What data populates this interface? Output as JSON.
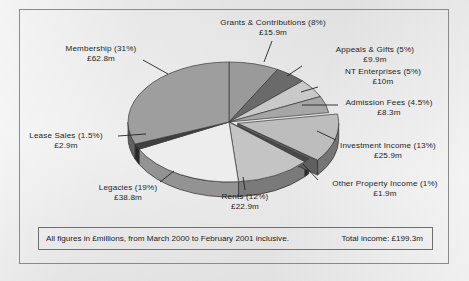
{
  "chart_data": {
    "type": "pie",
    "title": "",
    "units": "£ millions",
    "total_label": "Total income: £199.3m",
    "total_value": 199.3,
    "legend": "none",
    "categories": [
      "Grants & Contributions",
      "Appeals & Gifts",
      "NT Enterprises",
      "Admission Fees",
      "Investment Income",
      "Other Property Income",
      "Rents",
      "Legacies",
      "Lease Sales",
      "Membership"
    ],
    "percentages": [
      8,
      5,
      5,
      4.5,
      13,
      1,
      12,
      19,
      1.5,
      31
    ],
    "values": [
      15.9,
      9.9,
      10,
      8.3,
      25.9,
      1.9,
      22.9,
      38.8,
      2.9,
      62.8
    ],
    "value_labels": [
      "£15.9m",
      "£9.9m",
      "£10m",
      "£8.3m",
      "£25.9m",
      "£1.9m",
      "£22.9m",
      "£38.8m",
      "£2.9m",
      "£62.8m"
    ],
    "percent_labels": [
      "(8%)",
      "(5%)",
      "(5%)",
      "(4.5%)",
      "(13%)",
      "(1%)",
      "(12%)",
      "(19%)",
      "(1.5%)",
      "(31%)"
    ],
    "colors": [
      "#9a9a9a",
      "#6a6a6a",
      "#c9c9c9",
      "#a6a6a6",
      "#bdbdbd",
      "#4a4a4a",
      "#c4c4c4",
      "#ededed",
      "#3f3f3f",
      "#9e9e9e"
    ],
    "exploded": [
      "Investment Income"
    ],
    "start_angle_deg": 0,
    "direction": "clockwise",
    "three_d": true
  },
  "labels": {
    "grants": {
      "name": "Grants & Contributions (8%)",
      "value": "£15.9m"
    },
    "appeals": {
      "name": "Appeals & Gifts (5%)",
      "value": "£9.9m"
    },
    "nt": {
      "name": "NT Enterprises (5%)",
      "value": "£10m"
    },
    "admission": {
      "name": "Admission Fees (4.5%)",
      "value": "£8.3m"
    },
    "investment": {
      "name": "Investment Income (13%)",
      "value": "£25.9m"
    },
    "otherprop": {
      "name": "Other Property Income (1%)",
      "value": "£1.9m"
    },
    "rents": {
      "name": "Rents (12%)",
      "value": "£22.9m"
    },
    "legacies": {
      "name": "Legacies (19%)",
      "value": "£38.8m"
    },
    "leasesales": {
      "name": "Lease Sales (1.5%)",
      "value": "£2.9m"
    },
    "membership": {
      "name": "Membership (31%)",
      "value": "£62.8m"
    }
  },
  "footer": {
    "note": "All figures in £millions, from March 2000 to February 2001 inclusive.",
    "total": "Total income: £199.3m"
  }
}
